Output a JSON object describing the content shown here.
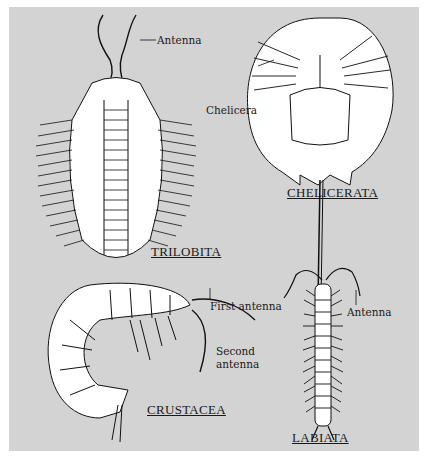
{
  "figure": {
    "groups": [
      {
        "id": "trilobita",
        "name": "TRILOBITA",
        "labels": [
          "Antenna"
        ]
      },
      {
        "id": "chelicerata",
        "name": "CHELICERATA",
        "labels": [
          "Chelicera"
        ]
      },
      {
        "id": "crustacea",
        "name": "CRUSTACEA",
        "labels": [
          "First antenna",
          "Second antenna"
        ]
      },
      {
        "id": "labiata",
        "name": "LABIATA",
        "labels": [
          "Antenna"
        ]
      }
    ],
    "labels": {
      "trilobita_antenna": "Antenna",
      "chelicera": "Chelicera",
      "first_antenna": "First antenna",
      "second_antenna_line1": "Second",
      "second_antenna_line2": "antenna",
      "labiata_antenna": "Antenna"
    },
    "titles": {
      "trilobita": "TRILOBITA",
      "chelicerata": "CHELICERATA",
      "crustacea": "CRUSTACEA",
      "labiata": "LABIATA"
    }
  }
}
